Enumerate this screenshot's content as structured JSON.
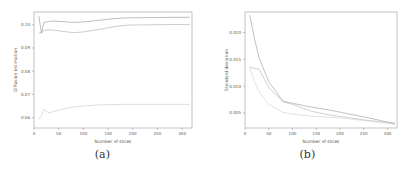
{
  "figure": {
    "panels": [
      {
        "id": "panel-a",
        "caption": "(a)",
        "xlabel": "Number of slices",
        "ylabel": "Diffusion estimation",
        "xticks": [
          "0",
          "50",
          "100",
          "150",
          "200",
          "250",
          "300"
        ],
        "yticks": [
          "0.06",
          "0.07",
          "0.08",
          "0.09",
          "0.10"
        ]
      },
      {
        "id": "panel-b",
        "caption": "(b)",
        "xlabel": "Number of slices",
        "ylabel": "Standard deviation",
        "xticks": [
          "0",
          "50",
          "100",
          "150",
          "200",
          "250",
          "300"
        ],
        "yticks": [
          "0.005",
          "0.010",
          "0.015",
          "0.020"
        ]
      }
    ]
  },
  "chart_data": [
    {
      "type": "line",
      "title": "(a)",
      "xlabel": "Number of slices",
      "ylabel": "Diffusion estimation",
      "xlim": [
        0,
        320
      ],
      "ylim": [
        0.0555,
        0.1055
      ],
      "xticks": [
        0,
        50,
        100,
        150,
        200,
        250,
        300
      ],
      "yticks": [
        0.06,
        0.07,
        0.08,
        0.09,
        0.1
      ],
      "grid": false,
      "legend": "none",
      "series": [
        {
          "name": "curve-upper",
          "color": "#8a8a8a",
          "x": [
            10,
            15,
            20,
            30,
            40,
            60,
            80,
            100,
            120,
            140,
            160,
            180,
            200,
            240,
            280,
            315
          ],
          "y": [
            0.1035,
            0.0963,
            0.101,
            0.1014,
            0.1016,
            0.1013,
            0.101,
            0.1012,
            0.1017,
            0.1021,
            0.1026,
            0.1029,
            0.103,
            0.1031,
            0.1032,
            0.1032
          ]
        },
        {
          "name": "curve-middle",
          "color": "#a5a5a5",
          "x": [
            10,
            15,
            20,
            30,
            40,
            60,
            80,
            100,
            120,
            140,
            160,
            180,
            200,
            240,
            280,
            315
          ],
          "y": [
            0.0963,
            0.0967,
            0.0976,
            0.0978,
            0.0977,
            0.0971,
            0.0966,
            0.0969,
            0.0976,
            0.0983,
            0.0991,
            0.0997,
            0.0999,
            0.1,
            0.1001,
            0.1001
          ]
        },
        {
          "name": "curve-lower",
          "color": "#c0c0c0",
          "x": [
            10,
            15,
            20,
            30,
            40,
            60,
            80,
            100,
            120,
            140,
            160,
            180,
            200,
            240,
            280,
            315
          ],
          "y": [
            0.0594,
            0.0606,
            0.0636,
            0.062,
            0.0627,
            0.0637,
            0.0645,
            0.065,
            0.0653,
            0.0655,
            0.0656,
            0.0657,
            0.0657,
            0.0657,
            0.0657,
            0.0657
          ]
        }
      ]
    },
    {
      "type": "line",
      "title": "(b)",
      "xlabel": "Number of slices",
      "ylabel": "Standard deviation",
      "xlim": [
        0,
        320
      ],
      "ylim": [
        0.0022,
        0.0238
      ],
      "xticks": [
        0,
        50,
        100,
        150,
        200,
        250,
        300
      ],
      "yticks": [
        0.005,
        0.01,
        0.015,
        0.02
      ],
      "grid": false,
      "legend": "none",
      "series": [
        {
          "name": "sd-curve-high",
          "color": "#8f8f8f",
          "x": [
            10,
            20,
            30,
            50,
            80,
            100,
            140,
            180,
            220,
            260,
            300,
            315
          ],
          "y": [
            0.0232,
            0.0188,
            0.0152,
            0.0108,
            0.0072,
            0.0068,
            0.0061,
            0.0055,
            0.0048,
            0.0041,
            0.0033,
            0.0031
          ]
        },
        {
          "name": "sd-curve-mid",
          "color": "#ababab",
          "x": [
            10,
            20,
            30,
            50,
            80,
            100,
            140,
            180,
            220,
            260,
            300,
            315
          ],
          "y": [
            0.0135,
            0.0133,
            0.0131,
            0.0097,
            0.0071,
            0.0066,
            0.0053,
            0.0046,
            0.0041,
            0.0036,
            0.0032,
            0.003
          ]
        },
        {
          "name": "sd-curve-low",
          "color": "#cacaca",
          "x": [
            10,
            20,
            30,
            50,
            80,
            100,
            140,
            180,
            220,
            260,
            300,
            315
          ],
          "y": [
            0.0133,
            0.0108,
            0.0089,
            0.0066,
            0.0051,
            0.0048,
            0.0044,
            0.0042,
            0.0039,
            0.0035,
            0.0031,
            0.0029
          ]
        }
      ]
    }
  ]
}
